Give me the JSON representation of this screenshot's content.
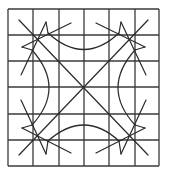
{
  "figure": {
    "colors": {
      "background": "#ffffff",
      "grid": "#3a3a3a",
      "figure": "#2a2a2a"
    },
    "grid": {
      "rows": 6,
      "cols": 6,
      "x_lines": [
        8,
        33,
        59,
        84,
        109,
        135,
        159
      ],
      "y_lines": [
        9,
        35,
        61,
        87,
        114,
        140,
        166
      ]
    },
    "center": [
      83.5,
      87.5
    ],
    "diagonals": [
      [
        19,
        20,
        148,
        155
      ],
      [
        148,
        20,
        19,
        155
      ]
    ],
    "arcs": {
      "top": "M 48 33 Q 84 66 119 33",
      "bottom": "M 48 141 Q 84 109 119 141",
      "left": "M 32 50 Q 66 88 32 125",
      "right": "M 135 50 Q 101 88 135 125"
    },
    "corner_lines": {
      "top_left": [
        [
          71,
          23,
          22,
          47
        ],
        [
          46,
          22,
          21,
          75
        ],
        [
          22,
          47,
          32,
          50
        ],
        [
          46,
          22,
          48,
          33
        ]
      ],
      "top_right": [
        [
          96,
          23,
          145,
          47
        ],
        [
          121,
          22,
          146,
          75
        ],
        [
          145,
          47,
          135,
          50
        ],
        [
          121,
          22,
          119,
          33
        ]
      ],
      "bottom_left": [
        [
          71,
          153,
          22,
          128
        ],
        [
          46,
          154,
          21,
          100
        ],
        [
          22,
          128,
          32,
          125
        ],
        [
          46,
          154,
          48,
          141
        ]
      ],
      "bottom_right": [
        [
          96,
          153,
          145,
          128
        ],
        [
          121,
          154,
          146,
          100
        ],
        [
          145,
          128,
          135,
          125
        ],
        [
          121,
          154,
          119,
          141
        ]
      ]
    }
  }
}
